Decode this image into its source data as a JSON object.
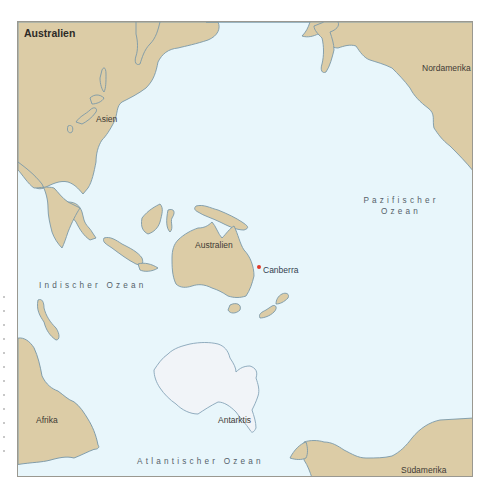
{
  "map": {
    "title": "Australien",
    "continents": [
      {
        "id": "asien",
        "label": "Asien"
      },
      {
        "id": "nordamerika",
        "label": "Nordamerika"
      },
      {
        "id": "australien",
        "label": "Australien"
      },
      {
        "id": "antarktis",
        "label": "Antarktis"
      },
      {
        "id": "afrika",
        "label": "Afrika"
      },
      {
        "id": "suedamerika",
        "label": "Südamerika"
      }
    ],
    "oceans": [
      {
        "id": "pazifik",
        "line1": "Pazifischer",
        "line2": "Ozean"
      },
      {
        "id": "indik",
        "label": "Indischer Ozean"
      },
      {
        "id": "atlantik",
        "label": "Atlantischer Ozean"
      }
    ],
    "cities": [
      {
        "id": "canberra",
        "label": "Canberra",
        "marker_color": "#e0382a"
      }
    ],
    "colors": {
      "land": "#dccca6",
      "water": "#e8f6fb",
      "ice": "#f1f4f8",
      "coastline": "#7a98a8"
    }
  }
}
